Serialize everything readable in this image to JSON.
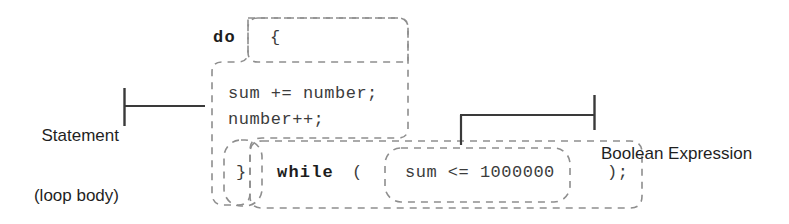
{
  "diagram": {
    "type": "annotated-code-syntax-diagram",
    "colors": {
      "code_text": "#3c3c3c",
      "keyword_text": "#1d1d1d",
      "label_text": "#1f1f1f",
      "dashed_outline": "#8e8e8e",
      "bracket_line": "#3a3a3a",
      "background": "#ffffff"
    }
  },
  "code": {
    "do_keyword": "do",
    "open_brace": "{",
    "body_line_1": "sum += number;",
    "body_line_2": "number++;",
    "close_brace": "}",
    "while_keyword": "while",
    "open_paren": "(",
    "condition": "sum <= 1000000",
    "close_paren_semicolon": ");"
  },
  "annotations": [
    {
      "id": "statement-loop-body",
      "line_1": "Statement",
      "line_2": "(loop body)",
      "side": "left"
    },
    {
      "id": "boolean-expression",
      "line_1": "Boolean Expression",
      "line_2": "",
      "side": "right"
    }
  ],
  "regions": [
    {
      "id": "open-brace-box",
      "label": "{"
    },
    {
      "id": "loop-body-outline",
      "label": "statement / loop body region"
    },
    {
      "id": "close-brace-box",
      "label": "}"
    },
    {
      "id": "while-clause-box",
      "label": "while ( ... )"
    },
    {
      "id": "condition-box",
      "label": "sum <= 1000000"
    }
  ]
}
